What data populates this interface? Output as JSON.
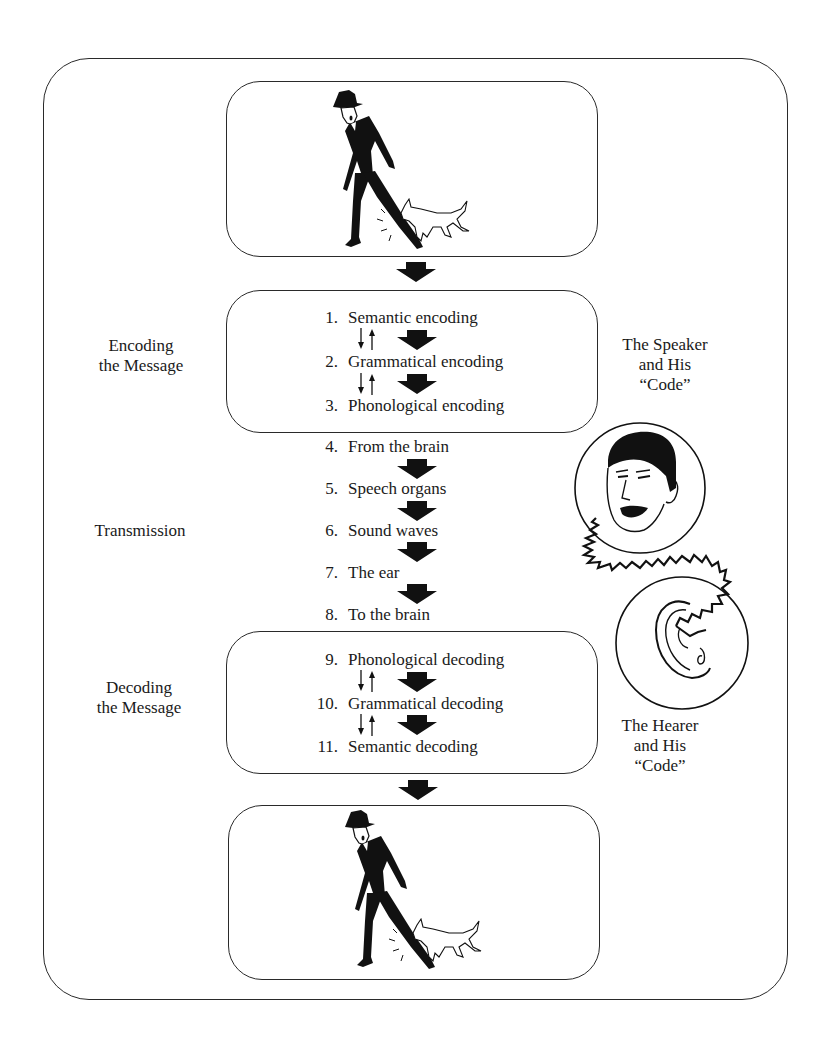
{
  "diagram": {
    "type": "flow",
    "title": "",
    "colors": {
      "line": "#2a2a2a",
      "fill": "#111111",
      "background": "#ffffff"
    },
    "panels": {
      "top_illustration": {
        "description": "Dog bites man's leg (stimulus event)",
        "icon": "man-bitten-by-dog-illustration"
      },
      "bottom_illustration": {
        "description": "Dog bites man's leg (understood event)",
        "icon": "man-bitten-by-dog-illustration"
      }
    },
    "stages": [
      {
        "label_line1": "Encoding",
        "label_line2": "the Message",
        "boxed": true,
        "steps": [
          {
            "num": "1.",
            "text": "Semantic encoding"
          },
          {
            "num": "2.",
            "text": "Grammatical encoding"
          },
          {
            "num": "3.",
            "text": "Phonological encoding"
          }
        ]
      },
      {
        "label_line1": "Transmission",
        "label_line2": "",
        "boxed": false,
        "steps": [
          {
            "num": "4.",
            "text": "From the brain"
          },
          {
            "num": "5.",
            "text": "Speech organs"
          },
          {
            "num": "6.",
            "text": "Sound waves"
          },
          {
            "num": "7.",
            "text": "The ear"
          },
          {
            "num": "8.",
            "text": "To the brain"
          }
        ]
      },
      {
        "label_line1": "Decoding",
        "label_line2": "the Message",
        "boxed": true,
        "steps": [
          {
            "num": "9.",
            "text": "Phonological decoding"
          },
          {
            "num": "10.",
            "text": "Grammatical decoding"
          },
          {
            "num": "11.",
            "text": "Semantic decoding"
          }
        ]
      }
    ],
    "right_labels": {
      "speaker": {
        "line1": "The Speaker",
        "line2": "and His",
        "line3": "“Code”",
        "icon": "speaker-face-icon"
      },
      "hearer": {
        "line1": "The Hearer",
        "line2": "and His",
        "line3": "“Code”",
        "icon": "ear-icon"
      }
    },
    "connector": {
      "icon": "sound-wave-squiggle",
      "from": "speaker-face",
      "to": "ear"
    }
  }
}
